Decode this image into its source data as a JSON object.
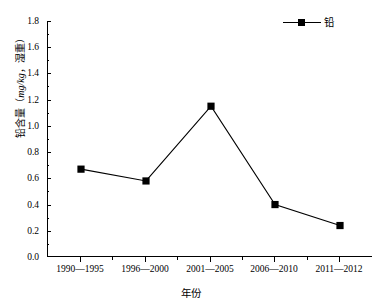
{
  "chart_data": {
    "type": "line",
    "title": "",
    "categories": [
      "1990—1995",
      "1996—2000",
      "2001—2005",
      "2006—2010",
      "2011—2012"
    ],
    "series": [
      {
        "name": "铅",
        "values": [
          0.67,
          0.58,
          1.15,
          0.4,
          0.24
        ],
        "marker": "square",
        "color": "#000000"
      }
    ],
    "xlabel": "年份",
    "ylabel": "铅含量（mg/kg，湿重）",
    "ylabel_prefix": "铅含量（",
    "ylabel_unit": "mg/kg",
    "ylabel_suffix": "，湿重）",
    "ylim": [
      0.0,
      1.8
    ],
    "ytick_step": 0.2,
    "yticks": [
      "1.8",
      "1.6",
      "1.4",
      "1.2",
      "1.0",
      "0.8",
      "0.6",
      "0.4",
      "0.2",
      "0.0"
    ],
    "ytick_values": [
      1.8,
      1.6,
      1.4,
      1.2,
      1.0,
      0.8,
      0.6,
      0.4,
      0.2,
      0.0
    ],
    "grid": false,
    "legend_position": "top-right",
    "legend_entries": [
      "铅"
    ]
  }
}
